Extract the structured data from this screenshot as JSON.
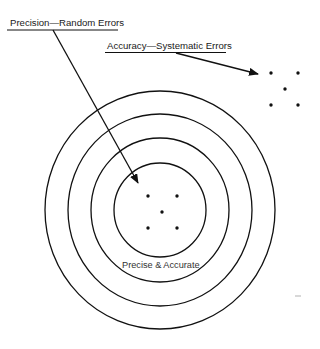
{
  "diagram": {
    "labels": {
      "precision": "Precision—Random Errors",
      "accuracy": "Accuracy—Systematic Errors",
      "center": "Precise & Accurate"
    },
    "target": {
      "center": [
        160,
        210
      ],
      "rings": [
        {
          "rx": 115,
          "ry": 119
        },
        {
          "rx": 92,
          "ry": 96
        },
        {
          "rx": 69,
          "ry": 72
        },
        {
          "rx": 46,
          "ry": 47
        }
      ]
    },
    "clusters": {
      "center_cluster": [
        [
          148,
          196
        ],
        [
          177,
          196
        ],
        [
          162,
          212
        ],
        [
          148,
          228
        ],
        [
          177,
          228
        ]
      ],
      "offset_cluster": [
        [
          271,
          73
        ],
        [
          298,
          73
        ],
        [
          285,
          89
        ],
        [
          271,
          105
        ],
        [
          298,
          105
        ]
      ]
    },
    "arrows": {
      "precision_arrow": {
        "from": [
          53,
          30
        ],
        "to": [
          138,
          183
        ]
      },
      "accuracy_arrow": {
        "from": [
          176,
          52
        ],
        "to": [
          258,
          74
        ]
      }
    },
    "colors": {
      "stroke": "#111111",
      "background": "#ffffff"
    }
  }
}
